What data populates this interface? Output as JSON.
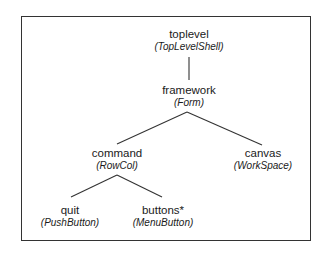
{
  "diagram": {
    "nodes": [
      {
        "id": "toplevel",
        "name": "toplevel",
        "class": "(TopLevelShell)"
      },
      {
        "id": "framework",
        "name": "framework",
        "class": "(Form)"
      },
      {
        "id": "command",
        "name": "command",
        "class": "(RowCol)"
      },
      {
        "id": "canvas",
        "name": "canvas",
        "class": "(WorkSpace)"
      },
      {
        "id": "quit",
        "name": "quit",
        "class": "(PushButton)"
      },
      {
        "id": "buttons",
        "name": "buttons*",
        "class": "(MenuButton)"
      }
    ],
    "edges": [
      {
        "from": "toplevel",
        "to": "framework"
      },
      {
        "from": "framework",
        "to": "command"
      },
      {
        "from": "framework",
        "to": "canvas"
      },
      {
        "from": "command",
        "to": "quit"
      },
      {
        "from": "command",
        "to": "buttons"
      }
    ]
  }
}
